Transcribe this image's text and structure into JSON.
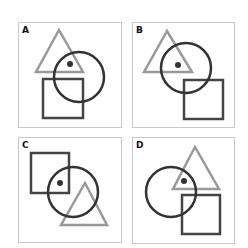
{
  "colors": {
    "frame": "#c8c8c8",
    "circle": "#333333",
    "square": "#444444",
    "triangle": "#999999",
    "dot": "#333333"
  },
  "panels": [
    {
      "label": "A",
      "frame": [
        18,
        22,
        103,
        105
      ],
      "triangle": "59,30 36,72 83,72",
      "circle": [
        79,
        77,
        25
      ],
      "dot": [
        70,
        64
      ],
      "square": [
        43,
        79,
        40,
        39
      ]
    },
    {
      "label": "B",
      "frame": [
        132,
        22,
        102,
        105
      ],
      "triangle": "167,31 144,72 192,72",
      "circle": [
        186,
        68,
        25
      ],
      "dot": [
        178,
        65
      ],
      "square": [
        184,
        80,
        39,
        39
      ]
    },
    {
      "label": "C",
      "frame": [
        18,
        137,
        103,
        105
      ],
      "triangle": "85,183 61,225 107,225",
      "circle": [
        73,
        192,
        25
      ],
      "dot": [
        60,
        183
      ],
      "square": [
        31,
        153,
        38,
        40
      ]
    },
    {
      "label": "D",
      "frame": [
        132,
        137,
        102,
        106
      ],
      "triangle": "195,147 173,189 219,189",
      "circle": [
        171,
        192,
        25
      ],
      "dot": [
        184,
        181
      ],
      "square": [
        182,
        195,
        38,
        39
      ]
    }
  ]
}
